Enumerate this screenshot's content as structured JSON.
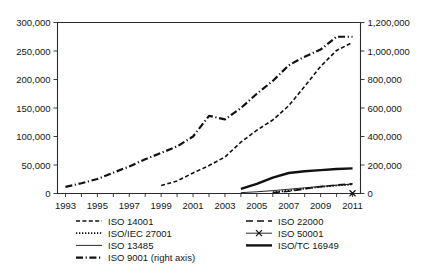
{
  "chart_data": {
    "type": "line",
    "title": "",
    "xlabel": "",
    "ylabel": "",
    "grid": false,
    "legend_position": "bottom",
    "x": [
      1993,
      1994,
      1995,
      1996,
      1997,
      1998,
      1999,
      2000,
      2001,
      2002,
      2003,
      2004,
      2005,
      2006,
      2007,
      2008,
      2009,
      2010,
      2011
    ],
    "xlim": [
      1992.5,
      2011.5
    ],
    "xticks": [
      1993,
      1995,
      1997,
      1999,
      2001,
      2003,
      2005,
      2007,
      2009,
      2011
    ],
    "xtick_labels": [
      "1993",
      "1995",
      "1997",
      "1999",
      "2001",
      "2003",
      "2005",
      "2007",
      "2009",
      "2011"
    ],
    "left_axis": {
      "ylim": [
        0,
        300000
      ],
      "yticks": [
        0,
        50000,
        100000,
        150000,
        200000,
        250000,
        300000
      ],
      "ytick_labels": [
        "0",
        "50,000",
        "100,000",
        "150,000",
        "200,000",
        "250,000",
        "300,000"
      ]
    },
    "right_axis": {
      "label": "right axis",
      "ylim": [
        0,
        1200000
      ],
      "yticks": [
        0,
        200000,
        400000,
        600000,
        800000,
        1000000,
        1200000
      ],
      "ytick_labels": [
        "0",
        "200,000",
        "400,000",
        "600,000",
        "800,000",
        "1,000,000",
        "1,200,000"
      ]
    },
    "series": [
      {
        "name": "ISO 9001 (right axis)",
        "legend_label": "ISO 9001 (right axis)",
        "axis": "right",
        "style": "dash-dot",
        "width": 2.2,
        "x": [
          1993,
          1994,
          1995,
          1996,
          1997,
          1998,
          1999,
          2000,
          2001,
          2002,
          2003,
          2004,
          2005,
          2006,
          2007,
          2008,
          2009,
          2010,
          2011
        ],
        "values": [
          46000,
          72000,
          102000,
          146000,
          190000,
          240000,
          285000,
          330000,
          400000,
          545000,
          520000,
          600000,
          700000,
          790000,
          900000,
          960000,
          1010000,
          1100000,
          1100000
        ]
      },
      {
        "name": "ISO 14001",
        "legend_label": "ISO 14001",
        "axis": "left",
        "style": "dashed",
        "width": 1.6,
        "x": [
          1999,
          2000,
          2001,
          2002,
          2003,
          2004,
          2005,
          2006,
          2007,
          2008,
          2009,
          2010,
          2011
        ],
        "values": [
          14000,
          22000,
          36000,
          49000,
          64000,
          90000,
          111000,
          129000,
          154000,
          188000,
          223000,
          251000,
          265000
        ]
      },
      {
        "name": "ISO/TC 16949",
        "legend_label": "ISO/TC 16949",
        "axis": "left",
        "style": "solid-thick",
        "width": 2.4,
        "x": [
          2004,
          2005,
          2006,
          2007,
          2008,
          2009,
          2010,
          2011
        ],
        "values": [
          8000,
          17000,
          28000,
          36000,
          39000,
          41000,
          43000,
          44000
        ]
      },
      {
        "name": "ISO 13485",
        "legend_label": "ISO 13485",
        "axis": "left",
        "style": "solid-thin",
        "width": 0.9,
        "x": [
          2004,
          2005,
          2006,
          2007,
          2008,
          2009,
          2010,
          2011
        ],
        "values": [
          1500,
          3000,
          5000,
          7500,
          10000,
          12500,
          14500,
          16500
        ]
      },
      {
        "name": "ISO 22000",
        "legend_label": "ISO 22000",
        "axis": "left",
        "style": "long-dash",
        "width": 1.6,
        "x": [
          2006,
          2007,
          2008,
          2009,
          2010,
          2011
        ],
        "values": [
          1500,
          4000,
          8000,
          12000,
          15000,
          17000
        ]
      },
      {
        "name": "ISO/IEC 27001",
        "legend_label": "ISO/IEC 27001",
        "axis": "left",
        "style": "dotted",
        "width": 1.8,
        "x": [
          2006,
          2007,
          2008,
          2009,
          2010,
          2011
        ],
        "values": [
          2000,
          5000,
          8500,
          11500,
          14000,
          16000
        ]
      },
      {
        "name": "ISO 50001",
        "legend_label": "ISO 50001",
        "axis": "left",
        "style": "marker-x",
        "width": 0.9,
        "x": [
          2011
        ],
        "values": [
          500
        ]
      }
    ]
  },
  "legend": {
    "column_left": [
      "ISO 14001",
      "ISO/IEC 27001",
      "ISO 13485",
      "ISO 9001 (right axis)"
    ],
    "column_right": [
      "ISO 22000",
      "ISO 50001",
      "ISO/TC 16949"
    ]
  }
}
